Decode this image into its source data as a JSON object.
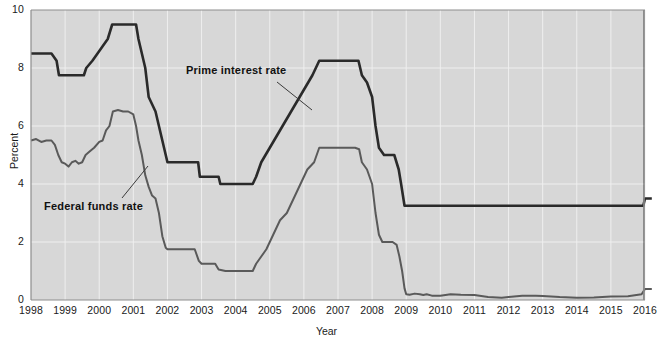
{
  "axes": {
    "ylabel": "Percent",
    "xlabel": "Year",
    "y_ticks": [
      "0",
      "2",
      "4",
      "6",
      "8",
      "10"
    ],
    "x_ticks": [
      "1998",
      "1999",
      "2000",
      "2001",
      "2002",
      "2003",
      "2004",
      "2005",
      "2006",
      "2007",
      "2008",
      "2009",
      "2010",
      "2011",
      "2012",
      "2013",
      "2014",
      "2015",
      "2016"
    ]
  },
  "annotations": {
    "prime": "Prime interest rate",
    "federal_funds": "Federal funds rate"
  },
  "colors": {
    "plot_background": "#d7d7d7",
    "gridline": "#efefef",
    "prime_line": "#2a2a2a",
    "federal_funds_line": "#5a5a5a",
    "axis": "#8d8d8d",
    "text": "#1a1a1a"
  },
  "chart_data": {
    "type": "line",
    "title": "",
    "xlabel": "Year",
    "ylabel": "Percent",
    "xlim": [
      1998,
      2016
    ],
    "ylim": [
      0,
      10
    ],
    "y_ticks": [
      0,
      2,
      4,
      6,
      8,
      10
    ],
    "x_ticks": [
      1998,
      1999,
      2000,
      2001,
      2002,
      2003,
      2004,
      2005,
      2006,
      2007,
      2008,
      2009,
      2010,
      2011,
      2012,
      2013,
      2014,
      2015,
      2016
    ],
    "grid": true,
    "legend": "annotated-inline",
    "series": [
      {
        "name": "Prime interest rate",
        "color": "#2a2a2a",
        "points": [
          [
            1998.0,
            8.5
          ],
          [
            1998.3,
            8.5
          ],
          [
            1998.6,
            8.5
          ],
          [
            1998.75,
            8.25
          ],
          [
            1998.82,
            7.75
          ],
          [
            1999.0,
            7.75
          ],
          [
            1999.3,
            7.75
          ],
          [
            1999.55,
            7.75
          ],
          [
            1999.62,
            8.0
          ],
          [
            1999.8,
            8.25
          ],
          [
            1999.95,
            8.5
          ],
          [
            2000.1,
            8.75
          ],
          [
            2000.25,
            9.0
          ],
          [
            2000.38,
            9.5
          ],
          [
            2000.5,
            9.5
          ],
          [
            2000.75,
            9.5
          ],
          [
            2001.0,
            9.5
          ],
          [
            2001.08,
            9.5
          ],
          [
            2001.15,
            9.0
          ],
          [
            2001.25,
            8.5
          ],
          [
            2001.35,
            8.0
          ],
          [
            2001.45,
            7.0
          ],
          [
            2001.55,
            6.75
          ],
          [
            2001.65,
            6.5
          ],
          [
            2001.75,
            6.0
          ],
          [
            2001.85,
            5.5
          ],
          [
            2002.0,
            4.75
          ],
          [
            2002.1,
            4.75
          ],
          [
            2002.5,
            4.75
          ],
          [
            2002.9,
            4.75
          ],
          [
            2002.95,
            4.25
          ],
          [
            2003.2,
            4.25
          ],
          [
            2003.5,
            4.25
          ],
          [
            2003.55,
            4.0
          ],
          [
            2003.8,
            4.0
          ],
          [
            2004.0,
            4.0
          ],
          [
            2004.3,
            4.0
          ],
          [
            2004.5,
            4.0
          ],
          [
            2004.6,
            4.25
          ],
          [
            2004.75,
            4.75
          ],
          [
            2005.0,
            5.25
          ],
          [
            2005.25,
            5.75
          ],
          [
            2005.5,
            6.25
          ],
          [
            2005.75,
            6.75
          ],
          [
            2006.0,
            7.25
          ],
          [
            2006.25,
            7.75
          ],
          [
            2006.45,
            8.25
          ],
          [
            2006.6,
            8.25
          ],
          [
            2007.0,
            8.25
          ],
          [
            2007.4,
            8.25
          ],
          [
            2007.6,
            8.25
          ],
          [
            2007.7,
            7.75
          ],
          [
            2007.85,
            7.5
          ],
          [
            2008.0,
            7.0
          ],
          [
            2008.1,
            6.0
          ],
          [
            2008.2,
            5.25
          ],
          [
            2008.35,
            5.0
          ],
          [
            2008.5,
            5.0
          ],
          [
            2008.65,
            5.0
          ],
          [
            2008.78,
            4.5
          ],
          [
            2008.85,
            4.0
          ],
          [
            2008.95,
            3.25
          ],
          [
            2009.0,
            3.25
          ],
          [
            2010.0,
            3.25
          ],
          [
            2011.0,
            3.25
          ],
          [
            2012.0,
            3.25
          ],
          [
            2013.0,
            3.25
          ],
          [
            2014.0,
            3.25
          ],
          [
            2015.0,
            3.25
          ],
          [
            2015.7,
            3.25
          ],
          [
            2015.95,
            3.25
          ],
          [
            2016.0,
            3.5
          ],
          [
            2016.2,
            3.5
          ]
        ]
      },
      {
        "name": "Federal funds rate",
        "color": "#5a5a5a",
        "points": [
          [
            1998.0,
            5.5
          ],
          [
            1998.15,
            5.55
          ],
          [
            1998.3,
            5.45
          ],
          [
            1998.45,
            5.5
          ],
          [
            1998.6,
            5.5
          ],
          [
            1998.7,
            5.35
          ],
          [
            1998.8,
            5.0
          ],
          [
            1998.9,
            4.75
          ],
          [
            1999.0,
            4.7
          ],
          [
            1999.1,
            4.6
          ],
          [
            1999.2,
            4.75
          ],
          [
            1999.3,
            4.8
          ],
          [
            1999.4,
            4.7
          ],
          [
            1999.5,
            4.75
          ],
          [
            1999.6,
            5.0
          ],
          [
            1999.7,
            5.1
          ],
          [
            1999.85,
            5.25
          ],
          [
            2000.0,
            5.45
          ],
          [
            2000.1,
            5.5
          ],
          [
            2000.2,
            5.85
          ],
          [
            2000.3,
            6.0
          ],
          [
            2000.4,
            6.5
          ],
          [
            2000.55,
            6.55
          ],
          [
            2000.7,
            6.5
          ],
          [
            2000.85,
            6.5
          ],
          [
            2001.0,
            6.4
          ],
          [
            2001.08,
            6.0
          ],
          [
            2001.15,
            5.5
          ],
          [
            2001.25,
            5.0
          ],
          [
            2001.35,
            4.3
          ],
          [
            2001.45,
            3.9
          ],
          [
            2001.55,
            3.6
          ],
          [
            2001.65,
            3.5
          ],
          [
            2001.75,
            3.0
          ],
          [
            2001.85,
            2.2
          ],
          [
            2001.95,
            1.8
          ],
          [
            2002.0,
            1.75
          ],
          [
            2002.2,
            1.75
          ],
          [
            2002.5,
            1.75
          ],
          [
            2002.8,
            1.75
          ],
          [
            2002.92,
            1.35
          ],
          [
            2003.0,
            1.25
          ],
          [
            2003.2,
            1.25
          ],
          [
            2003.4,
            1.25
          ],
          [
            2003.5,
            1.05
          ],
          [
            2003.7,
            1.0
          ],
          [
            2004.0,
            1.0
          ],
          [
            2004.3,
            1.0
          ],
          [
            2004.5,
            1.0
          ],
          [
            2004.6,
            1.25
          ],
          [
            2004.75,
            1.5
          ],
          [
            2004.9,
            1.75
          ],
          [
            2005.1,
            2.25
          ],
          [
            2005.3,
            2.75
          ],
          [
            2005.5,
            3.0
          ],
          [
            2005.7,
            3.5
          ],
          [
            2005.9,
            4.0
          ],
          [
            2006.1,
            4.5
          ],
          [
            2006.3,
            4.75
          ],
          [
            2006.45,
            5.25
          ],
          [
            2006.6,
            5.25
          ],
          [
            2007.0,
            5.25
          ],
          [
            2007.3,
            5.25
          ],
          [
            2007.5,
            5.25
          ],
          [
            2007.62,
            5.2
          ],
          [
            2007.7,
            4.75
          ],
          [
            2007.85,
            4.5
          ],
          [
            2008.0,
            4.0
          ],
          [
            2008.1,
            3.0
          ],
          [
            2008.2,
            2.25
          ],
          [
            2008.3,
            2.0
          ],
          [
            2008.45,
            2.0
          ],
          [
            2008.6,
            2.0
          ],
          [
            2008.72,
            1.9
          ],
          [
            2008.8,
            1.5
          ],
          [
            2008.88,
            1.0
          ],
          [
            2008.95,
            0.4
          ],
          [
            2009.0,
            0.2
          ],
          [
            2009.1,
            0.18
          ],
          [
            2009.25,
            0.22
          ],
          [
            2009.4,
            0.2
          ],
          [
            2009.5,
            0.17
          ],
          [
            2009.6,
            0.2
          ],
          [
            2009.75,
            0.15
          ],
          [
            2010.0,
            0.15
          ],
          [
            2010.3,
            0.2
          ],
          [
            2010.6,
            0.18
          ],
          [
            2011.0,
            0.17
          ],
          [
            2011.4,
            0.1
          ],
          [
            2011.8,
            0.08
          ],
          [
            2012.0,
            0.1
          ],
          [
            2012.4,
            0.15
          ],
          [
            2012.8,
            0.15
          ],
          [
            2013.0,
            0.14
          ],
          [
            2013.5,
            0.1
          ],
          [
            2014.0,
            0.08
          ],
          [
            2014.5,
            0.09
          ],
          [
            2015.0,
            0.12
          ],
          [
            2015.5,
            0.13
          ],
          [
            2015.9,
            0.2
          ],
          [
            2016.0,
            0.38
          ],
          [
            2016.2,
            0.38
          ]
        ]
      }
    ]
  }
}
